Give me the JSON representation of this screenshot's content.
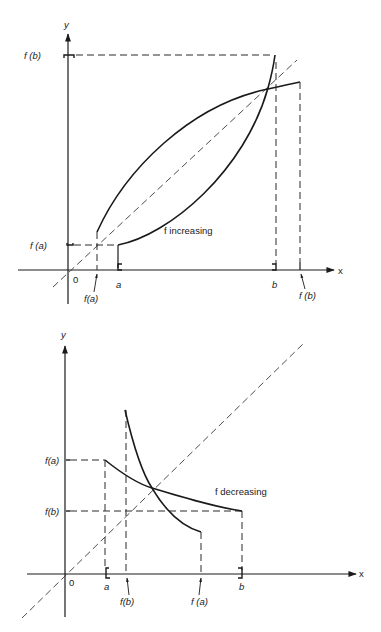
{
  "diagrams": [
    {
      "id": "top",
      "caption": "f increasing",
      "axes": {
        "x_label": "x",
        "y_label": "y",
        "origin_label": "0"
      },
      "y_ticks": [
        {
          "label": "f (b)"
        },
        {
          "label": "f (a)"
        }
      ],
      "x_ticks": [
        {
          "label": "f(a)"
        },
        {
          "label": "a"
        },
        {
          "label": "b"
        },
        {
          "label": "f (b)"
        }
      ]
    },
    {
      "id": "bottom",
      "caption": "f decreasing",
      "axes": {
        "x_label": "x",
        "y_label": "y",
        "origin_label": "0"
      },
      "y_ticks": [
        {
          "label": "f(a)"
        },
        {
          "label": "f(b)"
        }
      ],
      "x_ticks": [
        {
          "label": "a"
        },
        {
          "label": "f(b)"
        },
        {
          "label": "f (a)"
        },
        {
          "label": "b"
        }
      ]
    }
  ],
  "colors": {
    "ink": "#1a1a1a",
    "background": "#ffffff"
  }
}
